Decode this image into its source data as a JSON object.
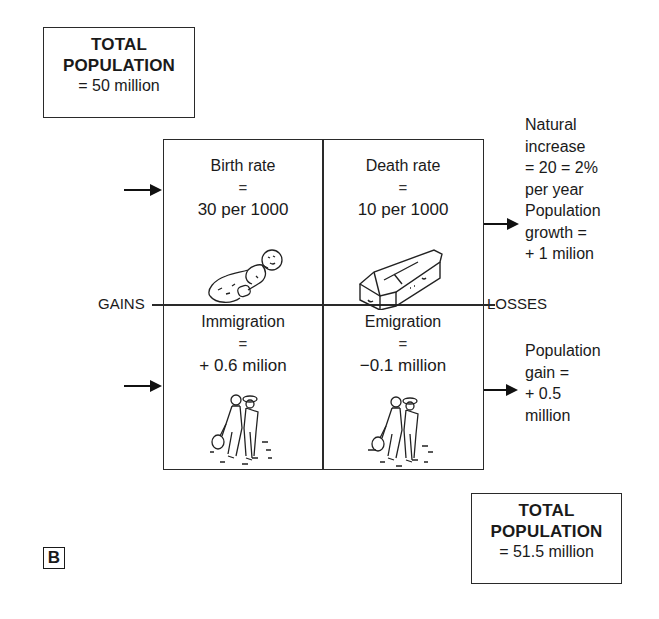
{
  "start_total": {
    "title_line1": "TOTAL",
    "title_line2": "POPULATION",
    "value": "= 50 million"
  },
  "grid": {
    "birth": {
      "label": "Birth rate",
      "eq": "=",
      "value": "30 per 1000",
      "icon": "baby-icon"
    },
    "death": {
      "label": "Death rate",
      "eq": "=",
      "value": "10 per 1000",
      "icon": "coffin-icon"
    },
    "immigration": {
      "label": "Immigration",
      "eq": "=",
      "value": "+ 0.6 milion",
      "icon": "migrants-icon"
    },
    "emigration": {
      "label": "Emigration",
      "eq": "=",
      "value": "−0.1 million",
      "icon": "migrants-icon"
    }
  },
  "side_labels": {
    "gains": "GAINS",
    "losses": "LOSSES"
  },
  "notes": {
    "natural_increase": [
      "Natural",
      "increase",
      "= 20 = 2%",
      "per year",
      "Population",
      "growth =",
      "+ 1 milion"
    ],
    "population_gain": [
      "Population",
      "gain =",
      "+ 0.5",
      "million"
    ]
  },
  "end_total": {
    "title_line1": "TOTAL",
    "title_line2": "POPULATION",
    "value": "= 51.5 million"
  },
  "panel_label": "B",
  "colors": {
    "ink": "#1a1a1a",
    "background": "#ffffff"
  }
}
